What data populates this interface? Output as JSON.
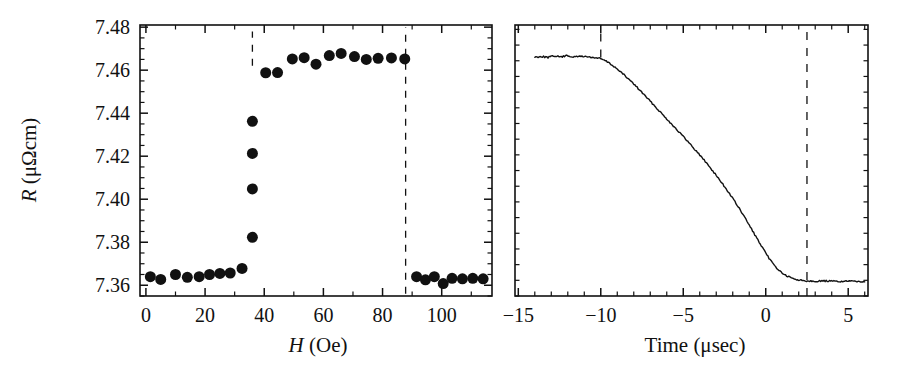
{
  "figure": {
    "title": "",
    "panels": [
      "left",
      "right"
    ]
  },
  "chart_data": [
    {
      "id": "left",
      "type": "scatter",
      "title": "",
      "xlabel": "H (Oe)",
      "xlabel_italic_part": "H",
      "xlabel_rest": " (Oe)",
      "ylabel": "R (μΩcm)",
      "ylabel_italic_part": "R",
      "ylabel_rest": " (μΩcm)",
      "xlim": [
        -2,
        117
      ],
      "ylim": [
        7.355,
        7.481
      ],
      "xticks": [
        0,
        20,
        40,
        60,
        80,
        100
      ],
      "xtick_labels": [
        "0",
        "20",
        "40",
        "60",
        "80",
        "100"
      ],
      "xminor_step": 10,
      "yticks": [
        7.36,
        7.38,
        7.4,
        7.42,
        7.44,
        7.46,
        7.48
      ],
      "ytick_labels": [
        "7.36",
        "7.38",
        "7.40",
        "7.42",
        "7.44",
        "7.46",
        "7.48"
      ],
      "yminor_step": 0.005,
      "grid": false,
      "legend": "none",
      "marker": "filled-circle",
      "marker_color": "#111111",
      "marker_size_px": 11,
      "x": [
        1.5,
        5.0,
        10.0,
        14.0,
        18.0,
        21.5,
        25.0,
        28.5,
        32.5,
        36.0,
        36.0,
        36.0,
        36.0,
        40.5,
        44.5,
        49.5,
        53.5,
        57.5,
        62.0,
        66.0,
        70.5,
        74.5,
        78.5,
        83.0,
        87.5,
        91.5,
        94.5,
        97.5,
        100.5,
        103.5,
        107.0,
        110.5,
        114.0
      ],
      "y": [
        7.364,
        7.3627,
        7.365,
        7.3637,
        7.364,
        7.365,
        7.3655,
        7.3657,
        7.3678,
        7.3823,
        7.4048,
        7.4213,
        7.4362,
        7.4588,
        7.4589,
        7.4652,
        7.4658,
        7.4628,
        7.4668,
        7.4678,
        7.4663,
        7.465,
        7.4655,
        7.4657,
        7.4652,
        7.364,
        7.3625,
        7.364,
        7.3608,
        7.3632,
        7.363,
        7.3632,
        7.363
      ],
      "annotations": [
        {
          "type": "vline",
          "style": "dashed",
          "x": 36.0,
          "y_from": 7.462,
          "y_to": 7.478,
          "label": "switch-field-marker-low"
        },
        {
          "type": "vline",
          "style": "dashed",
          "x": 87.8,
          "y_from": 7.356,
          "y_to": 7.48,
          "label": "switch-field-marker-high"
        }
      ]
    },
    {
      "id": "right",
      "type": "line",
      "title": "",
      "xlabel": "Time (μsec)",
      "ylabel": "",
      "xlim": [
        -15.2,
        6.2
      ],
      "ylim": [
        0,
        1.08
      ],
      "xticks": [
        -15,
        -10,
        -5,
        0,
        5
      ],
      "xtick_labels": [
        "−15",
        "−10",
        "−5",
        "0",
        "5"
      ],
      "xminor_step": 1,
      "yticks": [],
      "ytick_labels": [],
      "yminor_step": 0.0625,
      "grid": false,
      "legend": "none",
      "line_color": "#111111",
      "line_width_px": 1.4,
      "x": [
        -14.0,
        -13.6,
        -13.2,
        -12.8,
        -12.4,
        -12.0,
        -11.6,
        -11.2,
        -10.8,
        -10.4,
        -10.0,
        -9.6,
        -9.2,
        -8.8,
        -8.4,
        -8.0,
        -7.6,
        -7.2,
        -6.8,
        -6.4,
        -6.0,
        -5.6,
        -5.2,
        -4.8,
        -4.4,
        -4.0,
        -3.6,
        -3.2,
        -2.8,
        -2.4,
        -2.0,
        -1.6,
        -1.2,
        -0.8,
        -0.4,
        0.0,
        0.4,
        0.8,
        1.2,
        1.6,
        2.0,
        2.4,
        2.8,
        3.2,
        3.6,
        4.0,
        4.4,
        4.8,
        5.2,
        5.6,
        6.0
      ],
      "y": [
        0.952,
        0.955,
        0.951,
        0.957,
        0.953,
        0.958,
        0.952,
        0.956,
        0.953,
        0.95,
        0.946,
        0.933,
        0.915,
        0.893,
        0.87,
        0.845,
        0.818,
        0.79,
        0.762,
        0.734,
        0.706,
        0.678,
        0.65,
        0.621,
        0.592,
        0.562,
        0.531,
        0.498,
        0.463,
        0.427,
        0.389,
        0.348,
        0.305,
        0.26,
        0.214,
        0.17,
        0.132,
        0.102,
        0.082,
        0.07,
        0.064,
        0.061,
        0.06,
        0.059,
        0.06,
        0.059,
        0.058,
        0.059,
        0.058,
        0.059,
        0.058
      ],
      "annotations": [
        {
          "type": "vline",
          "style": "dashed",
          "x": -10.0,
          "y_from": 0.95,
          "y_to": 1.08,
          "label": "pulse-start-marker"
        },
        {
          "type": "vline",
          "style": "dashed",
          "x": 2.5,
          "y_from": 0.0,
          "y_to": 1.08,
          "label": "pulse-end-marker"
        }
      ]
    }
  ]
}
